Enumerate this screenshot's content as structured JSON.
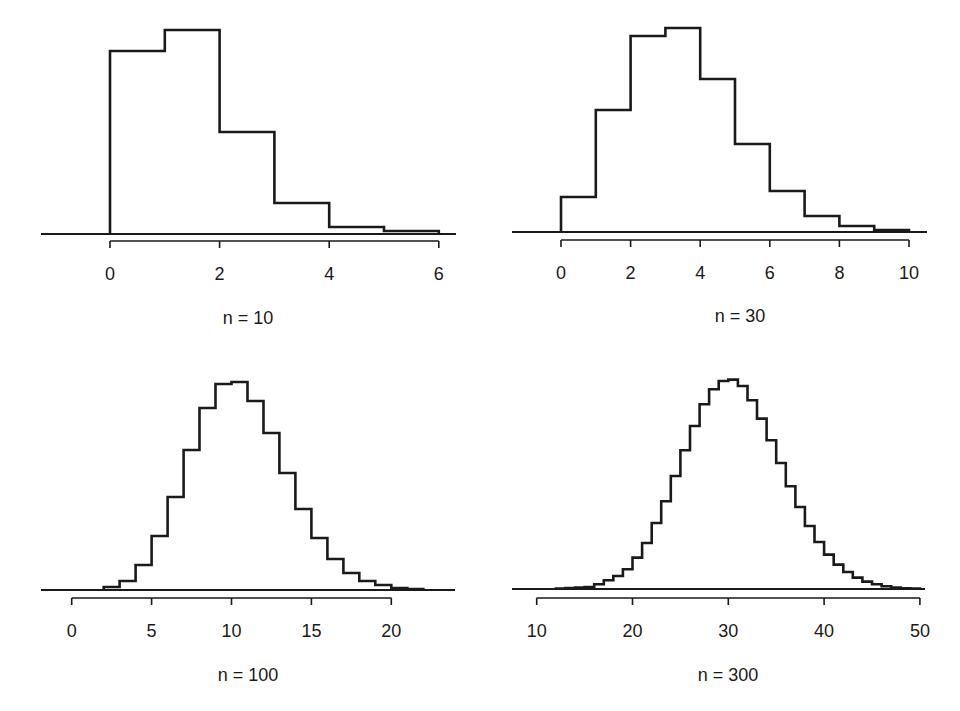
{
  "chart_data": [
    {
      "type": "bar",
      "subtype": "step-histogram",
      "title": "n = 10",
      "xlabel": "",
      "ylabel": "",
      "xlim": [
        -1.3,
        6.1
      ],
      "xticks": [
        0,
        2,
        4,
        6
      ],
      "tick_labels": [
        "0",
        "2",
        "4",
        "6"
      ],
      "grid": false,
      "y_axis_shown": false,
      "bin_edges": [
        0,
        1,
        2,
        3,
        4,
        5,
        6
      ],
      "values": [
        183,
        204,
        102,
        31,
        7,
        3
      ],
      "values_unit": "relative height (px, no y-axis shown)"
    },
    {
      "type": "bar",
      "subtype": "step-histogram",
      "title": "n = 30",
      "xlabel": "",
      "ylabel": "",
      "xlim": [
        -1.4,
        10.2
      ],
      "xticks": [
        0,
        2,
        4,
        6,
        8,
        10
      ],
      "tick_labels": [
        "0",
        "2",
        "4",
        "6",
        "8",
        "10"
      ],
      "grid": false,
      "y_axis_shown": false,
      "bin_edges": [
        0,
        1,
        2,
        3,
        4,
        5,
        6,
        7,
        8,
        9,
        10
      ],
      "values": [
        35,
        122,
        196,
        204,
        153,
        88,
        41,
        16,
        6,
        2
      ],
      "values_unit": "relative height (px, no y-axis shown)"
    },
    {
      "type": "bar",
      "subtype": "step-histogram",
      "title": "n = 100",
      "xlabel": "",
      "ylabel": "",
      "xlim": [
        -1.9,
        24
      ],
      "xticks": [
        0,
        5,
        10,
        15,
        20
      ],
      "tick_labels": [
        "0",
        "5",
        "10",
        "15",
        "20"
      ],
      "grid": false,
      "y_axis_shown": false,
      "bin_edges": [
        2,
        3,
        4,
        5,
        6,
        7,
        8,
        9,
        10,
        11,
        12,
        13,
        14,
        15,
        16,
        17,
        18,
        19,
        20,
        21,
        22
      ],
      "values": [
        3,
        9,
        25,
        54,
        93,
        140,
        182,
        206,
        208,
        189,
        157,
        117,
        81,
        52,
        31,
        17,
        9,
        5,
        2,
        1
      ],
      "values_unit": "relative height (px, no y-axis shown)"
    },
    {
      "type": "bar",
      "subtype": "step-histogram",
      "title": "n = 300",
      "xlabel": "",
      "ylabel": "",
      "xlim": [
        7.5,
        50.2
      ],
      "xticks": [
        10,
        20,
        30,
        40,
        50
      ],
      "tick_labels": [
        "10",
        "20",
        "30",
        "40",
        "50"
      ],
      "grid": false,
      "y_axis_shown": false,
      "bin_edges": [
        12,
        13,
        14,
        15,
        16,
        17,
        18,
        19,
        20,
        21,
        22,
        23,
        24,
        25,
        26,
        27,
        28,
        29,
        30,
        31,
        32,
        33,
        34,
        35,
        36,
        37,
        38,
        39,
        40,
        41,
        42,
        43,
        44,
        45,
        46,
        47,
        48,
        49,
        50
      ],
      "values": [
        0.5,
        1,
        1.5,
        2,
        4.7,
        8.7,
        13,
        19.7,
        31.4,
        46,
        66,
        87.7,
        113,
        138.7,
        163,
        184.7,
        199.7,
        208,
        209.4,
        203,
        188.7,
        170.4,
        148.7,
        126,
        102.7,
        82,
        63,
        47,
        34.4,
        24.4,
        17,
        11.4,
        7.4,
        4.7,
        2.7,
        1.4,
        0.8,
        0.4
      ],
      "values_unit": "relative height (px, no y-axis shown)"
    }
  ],
  "layout": {
    "panels": [
      {
        "name": "panel-n10",
        "plot_left": 41,
        "plot_right": 456,
        "baseline_y": 234,
        "axis_y": 241,
        "x0_px": 110,
        "px_per_unit": 54.8,
        "caption_x": 248,
        "caption_y": 324
      },
      {
        "name": "panel-n30",
        "plot_left": 512,
        "plot_right": 927,
        "baseline_y": 232,
        "axis_y": 240,
        "x0_px": 561,
        "px_per_unit": 34.8,
        "caption_x": 740,
        "caption_y": 322
      },
      {
        "name": "panel-n100",
        "plot_left": 41,
        "plot_right": 455,
        "baseline_y": 590,
        "axis_y": 598,
        "x0_px": 71.7,
        "px_per_unit": 15.98,
        "caption_x": 248,
        "caption_y": 681
      },
      {
        "name": "panel-n300",
        "plot_left": 512,
        "plot_right": 925,
        "baseline_y": 589,
        "axis_y": 598,
        "x0_px": 441,
        "px_per_unit": 9.58,
        "caption_x": 728,
        "caption_y": 681
      }
    ]
  }
}
